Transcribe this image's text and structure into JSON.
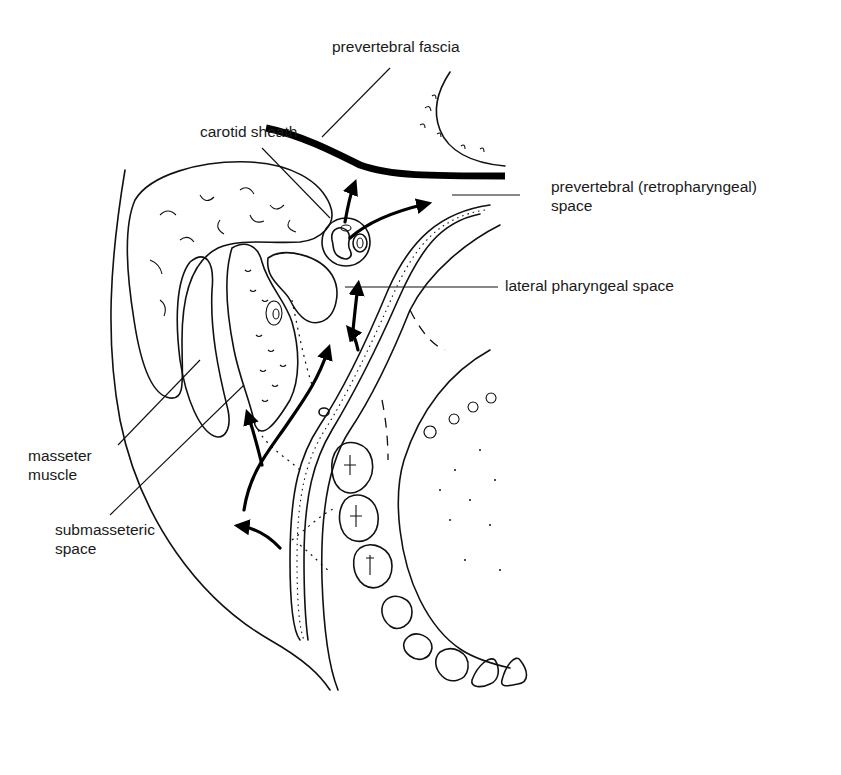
{
  "figure": {
    "type": "anatomical line drawing"
  },
  "labels": {
    "prevertebral_fascia": "prevertebral fascia",
    "carotid_sheath": "carotid sheath",
    "prevertebral_space_line1": "prevertebral (retropharyngeal)",
    "prevertebral_space_line2": "space",
    "lateral_pharyngeal_space": "lateral pharyngeal space",
    "masseter_line1": "masseter",
    "masseter_line2": "muscle",
    "submasseteric_line1": "submasseteric",
    "submasseteric_line2": "space"
  },
  "structures": [
    "parotid-gland",
    "masseter-muscle",
    "mandibular-ramus",
    "medial-pterygoid-muscle",
    "carotid-sheath",
    "prevertebral-fascia",
    "vertebral-body",
    "pharyngeal-wall",
    "tongue",
    "teeth",
    "spread-arrows"
  ],
  "colors": {
    "ink": "#111111",
    "background": "#ffffff"
  }
}
